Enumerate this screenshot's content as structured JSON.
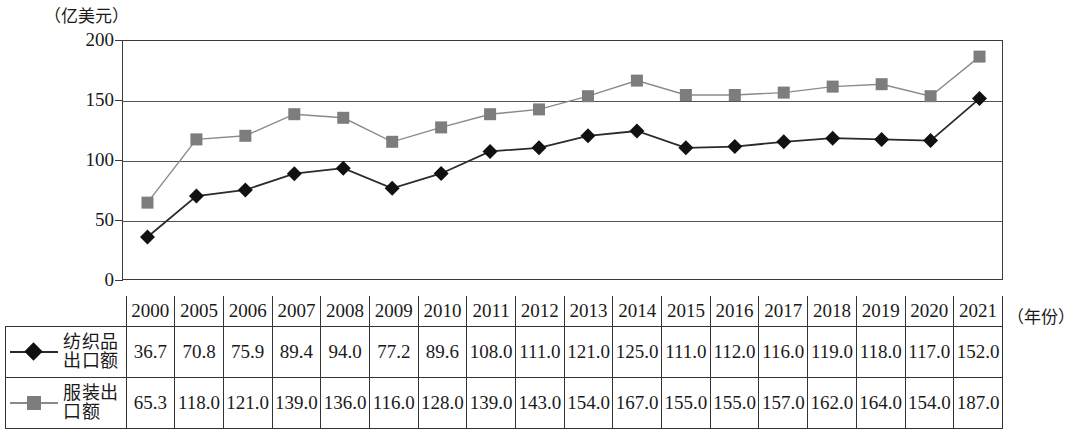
{
  "axes": {
    "y_unit_label": "（亿美元）",
    "x_unit_label": "（年份）",
    "y_ticks": [
      "0",
      "50",
      "100",
      "150",
      "200"
    ]
  },
  "colors": {
    "series1_marker": "#111111",
    "series1_line": "#2b2b2b",
    "series2_marker": "#7d7d7d",
    "series2_line": "#8a8a8a",
    "grid": "#555555",
    "border": "#3a3a3a"
  },
  "table": {
    "year_header": [
      "2000",
      "2005",
      "2006",
      "2007",
      "2008",
      "2009",
      "2010",
      "2011",
      "2012",
      "2013",
      "2014",
      "2015",
      "2016",
      "2017",
      "2018",
      "2019",
      "2020",
      "2021"
    ],
    "rows": [
      {
        "label": "纺织品出口额",
        "label_line1": "纺织品",
        "label_line2": "出口额",
        "marker": "diamond-marker",
        "values": [
          "36.7",
          "70.8",
          "75.9",
          "89.4",
          "94.0",
          "77.2",
          "89.6",
          "108.0",
          "111.0",
          "121.0",
          "125.0",
          "111.0",
          "112.0",
          "116.0",
          "119.0",
          "118.0",
          "117.0",
          "152.0"
        ]
      },
      {
        "label": "服装出口额",
        "label_line1": "服装出",
        "label_line2": "口额",
        "marker": "square-marker",
        "values": [
          "65.3",
          "118.0",
          "121.0",
          "139.0",
          "136.0",
          "116.0",
          "128.0",
          "139.0",
          "143.0",
          "154.0",
          "167.0",
          "155.0",
          "155.0",
          "157.0",
          "162.0",
          "164.0",
          "154.0",
          "187.0"
        ]
      }
    ]
  },
  "chart_data": {
    "type": "line",
    "title": "",
    "xlabel": "（年份）",
    "ylabel": "（亿美元）",
    "ylim": [
      0,
      200
    ],
    "yticks": [
      0,
      50,
      100,
      150,
      200
    ],
    "grid": true,
    "legend": "table-row-labels",
    "categories": [
      "2000",
      "2005",
      "2006",
      "2007",
      "2008",
      "2009",
      "2010",
      "2011",
      "2012",
      "2013",
      "2014",
      "2015",
      "2016",
      "2017",
      "2018",
      "2019",
      "2020",
      "2021"
    ],
    "series": [
      {
        "name": "纺织品出口额",
        "marker": "diamond",
        "color": "#111111",
        "values": [
          36.7,
          70.8,
          75.9,
          89.4,
          94.0,
          77.2,
          89.6,
          108.0,
          111.0,
          121.0,
          125.0,
          111.0,
          112.0,
          116.0,
          119.0,
          118.0,
          117.0,
          152.0
        ]
      },
      {
        "name": "服装出口额",
        "marker": "square",
        "color": "#7d7d7d",
        "values": [
          65.3,
          118.0,
          121.0,
          139.0,
          136.0,
          116.0,
          128.0,
          139.0,
          143.0,
          154.0,
          167.0,
          155.0,
          155.0,
          157.0,
          162.0,
          164.0,
          154.0,
          187.0
        ]
      }
    ]
  }
}
